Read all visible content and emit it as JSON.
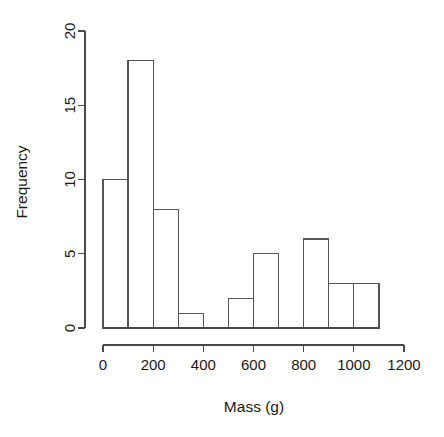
{
  "chart_data": {
    "type": "bar",
    "chart_subtype": "histogram",
    "title": "",
    "xlabel": "Mass (g)",
    "ylabel": "Frequency",
    "xlim": [
      0,
      1200
    ],
    "ylim": [
      0,
      20
    ],
    "grid": false,
    "legend": null,
    "bin_width": 100,
    "bin_edges": [
      0,
      100,
      200,
      300,
      400,
      500,
      600,
      700,
      800,
      900,
      1000,
      1100
    ],
    "categories": [
      "0-100",
      "100-200",
      "200-300",
      "300-400",
      "400-500",
      "500-600",
      "600-700",
      "700-800",
      "800-900",
      "900-1000",
      "1000-1100"
    ],
    "values": [
      10,
      18,
      8,
      1,
      0,
      2,
      5,
      0,
      6,
      3,
      3
    ],
    "bars": [
      {
        "x0": 0,
        "x1": 100,
        "freq": 10
      },
      {
        "x0": 100,
        "x1": 200,
        "freq": 18
      },
      {
        "x0": 200,
        "x1": 300,
        "freq": 8
      },
      {
        "x0": 300,
        "x1": 400,
        "freq": 1
      },
      {
        "x0": 400,
        "x1": 500,
        "freq": 0
      },
      {
        "x0": 500,
        "x1": 600,
        "freq": 2
      },
      {
        "x0": 600,
        "x1": 700,
        "freq": 5
      },
      {
        "x0": 700,
        "x1": 800,
        "freq": 0
      },
      {
        "x0": 800,
        "x1": 900,
        "freq": 6
      },
      {
        "x0": 900,
        "x1": 1000,
        "freq": 3
      },
      {
        "x0": 1000,
        "x1": 1100,
        "freq": 3
      }
    ],
    "xticks": [
      0,
      200,
      400,
      600,
      800,
      1000,
      1200
    ],
    "xtick_labels": [
      "0",
      "200",
      "400",
      "600",
      "800",
      "1000",
      "1200"
    ],
    "yticks": [
      0,
      5,
      10,
      15,
      20
    ],
    "ytick_labels": [
      "0",
      "5",
      "10",
      "15",
      "20"
    ],
    "colors": {
      "bar_fill": "#ffffff",
      "bar_stroke": "#555555",
      "axis": "#4a4a4a",
      "text": "#1a1a1a",
      "background": "#ffffff"
    }
  }
}
